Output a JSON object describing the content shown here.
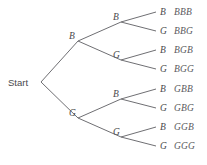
{
  "diagram": {
    "kind": "probability-tree",
    "root": {
      "label": "Start",
      "x": 8,
      "y": 86
    },
    "colors": {
      "background": "#ffffff",
      "line": "#6f6f73",
      "label_text": "#4a4a4d",
      "outcome_text": "#5a5a5e"
    },
    "level1": [
      {
        "label": "B",
        "label_x": 69,
        "label_y": 39,
        "node_x": 78,
        "node_y": 41
      },
      {
        "label": "G",
        "label_x": 69,
        "label_y": 116,
        "node_x": 78,
        "node_y": 118
      }
    ],
    "level2": [
      {
        "label": "B",
        "label_x": 113,
        "label_y": 20,
        "node_x": 121,
        "node_y": 22,
        "parent": 0
      },
      {
        "label": "G",
        "label_x": 113,
        "label_y": 58,
        "node_x": 121,
        "node_y": 60,
        "parent": 0
      },
      {
        "label": "B",
        "label_x": 113,
        "label_y": 97,
        "node_x": 121,
        "node_y": 99,
        "parent": 1
      },
      {
        "label": "G",
        "label_x": 113,
        "label_y": 135,
        "node_x": 121,
        "node_y": 137,
        "parent": 1
      }
    ],
    "leaves": [
      {
        "label": "B",
        "outcome": "BBB",
        "label_x": 160,
        "label_y": 15,
        "line_end_x": 156,
        "line_end_y": 12,
        "outcome_x": 174,
        "parent": 0
      },
      {
        "label": "G",
        "outcome": "BBG",
        "label_x": 160,
        "label_y": 34,
        "line_end_x": 156,
        "line_end_y": 31,
        "outcome_x": 174,
        "parent": 0
      },
      {
        "label": "B",
        "outcome": "BGB",
        "label_x": 160,
        "label_y": 53,
        "line_end_x": 156,
        "line_end_y": 50,
        "outcome_x": 174,
        "parent": 1
      },
      {
        "label": "G",
        "outcome": "BGG",
        "label_x": 160,
        "label_y": 72,
        "line_end_x": 156,
        "line_end_y": 69,
        "outcome_x": 174,
        "parent": 1
      },
      {
        "label": "B",
        "outcome": "GBB",
        "label_x": 160,
        "label_y": 92,
        "line_end_x": 156,
        "line_end_y": 89,
        "outcome_x": 174,
        "parent": 2
      },
      {
        "label": "G",
        "outcome": "GBG",
        "label_x": 160,
        "label_y": 111,
        "line_end_x": 156,
        "line_end_y": 108,
        "outcome_x": 174,
        "parent": 2
      },
      {
        "label": "B",
        "outcome": "GGB",
        "label_x": 160,
        "label_y": 130,
        "line_end_x": 156,
        "line_end_y": 127,
        "outcome_x": 174,
        "parent": 3
      },
      {
        "label": "G",
        "outcome": "GGG",
        "label_x": 160,
        "label_y": 149,
        "line_end_x": 156,
        "line_end_y": 146,
        "outcome_x": 174,
        "parent": 3
      }
    ]
  }
}
